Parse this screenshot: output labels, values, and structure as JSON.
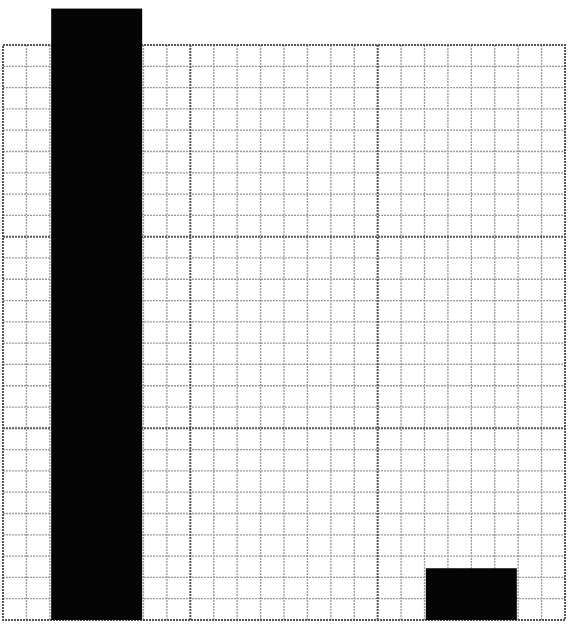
{
  "chart_data": {
    "type": "bar",
    "title": "",
    "xlabel": "",
    "ylabel": "",
    "categories": [
      "",
      "",
      ""
    ],
    "values": [
      3.19,
      0,
      0.27
    ],
    "ylim": [
      0,
      3
    ],
    "grid": true,
    "grid_major_x_divisions": 3,
    "grid_minor_x_per_major": 8,
    "grid_major_y_divisions": 3,
    "grid_minor_y_per_major": 9,
    "legend": null,
    "annotations": [
      "Bar 1 extends above plot area"
    ],
    "bar_color": "#000000"
  },
  "colors": {
    "background": "#ffffff",
    "bar": "#050505",
    "grid_major": "#555555",
    "grid_minor": "#999999"
  }
}
